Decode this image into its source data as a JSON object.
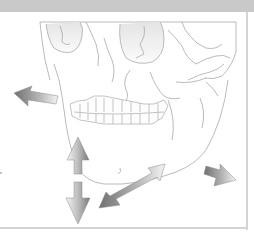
{
  "figure": {
    "colors": {
      "header_bar": "#c9c9c9",
      "frame_rule": "#d4d4d4",
      "line_art": "#a8a8a8",
      "bone_shading": "#e6e6e6",
      "arrow_dark": "#7a7a7a",
      "arrow_light": "#f2f2f2"
    },
    "arrows": [
      {
        "name": "retrusion-arrow",
        "direction": "up-left"
      },
      {
        "name": "opening-closing-arrow",
        "direction": "vertical-double"
      },
      {
        "name": "lateral-excursion-arrow",
        "direction": "diagonal-double"
      },
      {
        "name": "protrusion-arrow",
        "direction": "down-right"
      }
    ]
  }
}
